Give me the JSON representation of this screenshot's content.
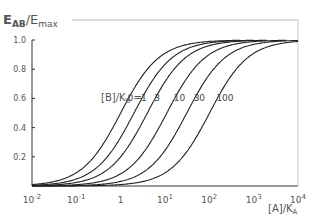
{
  "chart_data": {
    "type": "line",
    "title": "",
    "ylabel": "E_AB/E_max",
    "xlabel": "[A]/K_A",
    "xscale": "log",
    "xlim": [
      0.01,
      10000
    ],
    "ylim": [
      0,
      1.0
    ],
    "xticks": [
      "10^-2",
      "10^-1",
      "1",
      "10^1",
      "10^2",
      "10^3",
      "10^4"
    ],
    "yticks": [
      "0.2",
      "0.4",
      "0.6",
      "0.8",
      "1.0"
    ],
    "grid": false,
    "legend_label": "[B]/K_B =",
    "series": [
      {
        "name": "0",
        "ec50": 1,
        "ymax": 1.0
      },
      {
        "name": "1",
        "ec50": 2,
        "ymax": 1.0
      },
      {
        "name": "3",
        "ec50": 4,
        "ymax": 1.0
      },
      {
        "name": "10",
        "ec50": 11,
        "ymax": 1.0
      },
      {
        "name": "30",
        "ec50": 31,
        "ymax": 1.0
      },
      {
        "name": "100",
        "ec50": 101,
        "ymax": 1.0
      }
    ]
  },
  "axis": {
    "y_title_main": "E",
    "y_title_sub": "AB",
    "y_title_div": "/E",
    "y_title_sub2": "max",
    "x_title_main": "[A]/K",
    "x_title_sub": "A",
    "legend_main": "[B]/K",
    "legend_sub": "B",
    "legend_eq": " ="
  }
}
